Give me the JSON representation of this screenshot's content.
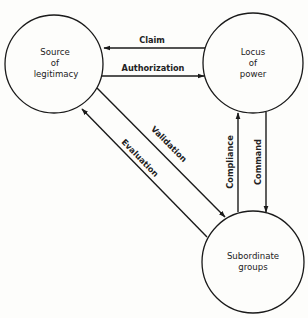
{
  "diagram": {
    "nodes": [
      {
        "id": "source",
        "lines": [
          "Source",
          "of",
          "legitimacy"
        ],
        "cx": 54,
        "cy": 64,
        "r": 49
      },
      {
        "id": "locus",
        "lines": [
          "Locus",
          "of",
          "power"
        ],
        "cx": 253,
        "cy": 63,
        "r": 50
      },
      {
        "id": "subordinate",
        "lines": [
          "Subordinate",
          "groups"
        ],
        "cx": 253,
        "cy": 262,
        "r": 51
      }
    ],
    "edges": [
      {
        "id": "claim",
        "label": "Claim",
        "from": "locus",
        "to": "source"
      },
      {
        "id": "authorization",
        "label": "Authorization",
        "from": "source",
        "to": "locus"
      },
      {
        "id": "validation",
        "label": "Validation",
        "from": "source",
        "to": "subordinate"
      },
      {
        "id": "evaluation",
        "label": "Evaluation",
        "from": "subordinate",
        "to": "source"
      },
      {
        "id": "compliance",
        "label": "Compliance",
        "from": "subordinate",
        "to": "locus"
      },
      {
        "id": "command",
        "label": "Command",
        "from": "locus",
        "to": "subordinate"
      }
    ]
  }
}
